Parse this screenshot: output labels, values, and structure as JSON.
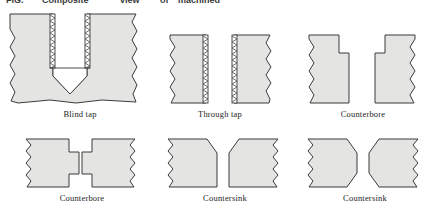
{
  "figure": {
    "title_fragment": "Composite view of machined holes",
    "background_color": "#ffffff",
    "metal_fill_color": "#e4e4e2",
    "outline_color": "#3b3b3b",
    "thread_color": "#555555",
    "void_color": "#ffffff"
  },
  "panels": [
    {
      "id": "blind-tap",
      "caption": "Blind tap",
      "feature": "threaded blind hole with conical bottom",
      "threaded": true,
      "through": false
    },
    {
      "id": "through-tap",
      "caption": "Through tap",
      "feature": "threaded hole passing fully through the stock",
      "threaded": true,
      "through": true
    },
    {
      "id": "counterbore-top",
      "caption": "Counterbore",
      "feature": "flat-bottomed wide recess above a smaller through hole",
      "threaded": false,
      "through": true
    },
    {
      "id": "counterbore-both",
      "caption": "Counterbore",
      "feature": "counterbored recesses on both faces of the stock",
      "threaded": false,
      "through": true
    },
    {
      "id": "countersink-top",
      "caption": "Countersink",
      "feature": "conical chamfer on the top face of a through hole",
      "threaded": false,
      "through": true
    },
    {
      "id": "countersink-both",
      "caption": "Countersink",
      "feature": "conical chamfers on both faces of a through hole",
      "threaded": false,
      "through": true
    }
  ]
}
